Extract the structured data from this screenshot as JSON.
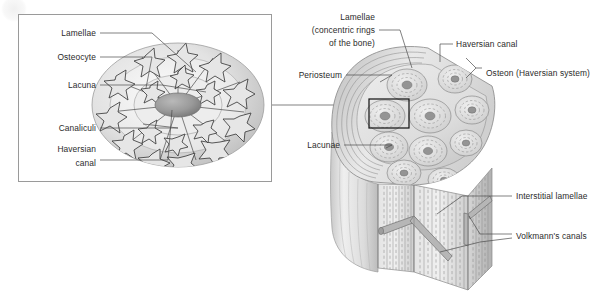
{
  "figure": {
    "background_color": "#ffffff",
    "label_color": "#2b2b2b",
    "leader_color": "#4a4a4a",
    "highlight_box_color": "#101010",
    "panel_border_color": "#9a9a9a",
    "bone_fill_light": "#e8e8e8",
    "bone_fill_mid": "#d2d2d2",
    "bone_fill_dark": "#a8a8a8",
    "canal_color": "#8f8f8f"
  },
  "inset_panel": {
    "name": "osteon-cross-section-inset",
    "labels": [
      {
        "id": "lamellae",
        "text": "Lamellae",
        "x": 96,
        "y": 36,
        "align": "end"
      },
      {
        "id": "osteocyte",
        "text": "Osteocyte",
        "x": 96,
        "y": 60,
        "align": "end"
      },
      {
        "id": "lacuna",
        "text": "Lacuna",
        "x": 96,
        "y": 88,
        "align": "end"
      },
      {
        "id": "canaliculi",
        "text": "Canaliculi",
        "x": 96,
        "y": 131,
        "align": "end"
      },
      {
        "id": "haversian-canal-1",
        "text": "Haversian",
        "x": 96,
        "y": 152,
        "align": "end"
      },
      {
        "id": "haversian-canal-2",
        "text": "canal",
        "x": 96,
        "y": 166,
        "align": "end"
      }
    ]
  },
  "main_figure": {
    "name": "compact-bone-3d-cutaway",
    "labels": [
      {
        "id": "lamellae-concentric-1",
        "text": "Lamellae",
        "x": 375,
        "y": 20,
        "align": "end"
      },
      {
        "id": "lamellae-concentric-2",
        "text": "(concentric rings",
        "x": 375,
        "y": 33,
        "align": "end"
      },
      {
        "id": "lamellae-concentric-3",
        "text": "of the bone)",
        "x": 375,
        "y": 46,
        "align": "end"
      },
      {
        "id": "periosteum",
        "text": "Periosteum",
        "x": 342,
        "y": 78,
        "align": "end"
      },
      {
        "id": "lacunae",
        "text": "Lacunae",
        "x": 340,
        "y": 148,
        "align": "end"
      },
      {
        "id": "haversian-canal",
        "text": "Haversian canal",
        "x": 455,
        "y": 47,
        "align": "start"
      },
      {
        "id": "osteon",
        "text": "Osteon (Haversian system)",
        "x": 485,
        "y": 76,
        "align": "start"
      },
      {
        "id": "interstitial-lamellae",
        "text": "Interstitial lamellae",
        "x": 515,
        "y": 199,
        "align": "start"
      },
      {
        "id": "volkmanns-canals",
        "text": "Volkmann's canals",
        "x": 515,
        "y": 239,
        "align": "start"
      }
    ]
  },
  "watermark": {
    "present": true,
    "description": "faint pale circular mark at top-left corner"
  }
}
